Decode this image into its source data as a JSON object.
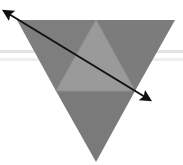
{
  "diagram": {
    "width": 183,
    "height": 165,
    "colors": {
      "background": "#ffffff",
      "outer_triangles": "#7d7d7d",
      "center_triangle": "#9a9a9a",
      "edges": "#8c8c8c",
      "arrow": "#111111",
      "background_band": "#e6e6e6"
    },
    "triangle": {
      "top_left": [
        17,
        20
      ],
      "top_right": [
        175,
        20
      ],
      "bottom": [
        96,
        162
      ],
      "midpoints": {
        "top": [
          96,
          20
        ],
        "left": [
          56,
          91
        ],
        "right": [
          135,
          91
        ]
      }
    },
    "arrow": {
      "start": [
        2,
        10
      ],
      "end": [
        155,
        103
      ],
      "double_headed": true
    }
  }
}
